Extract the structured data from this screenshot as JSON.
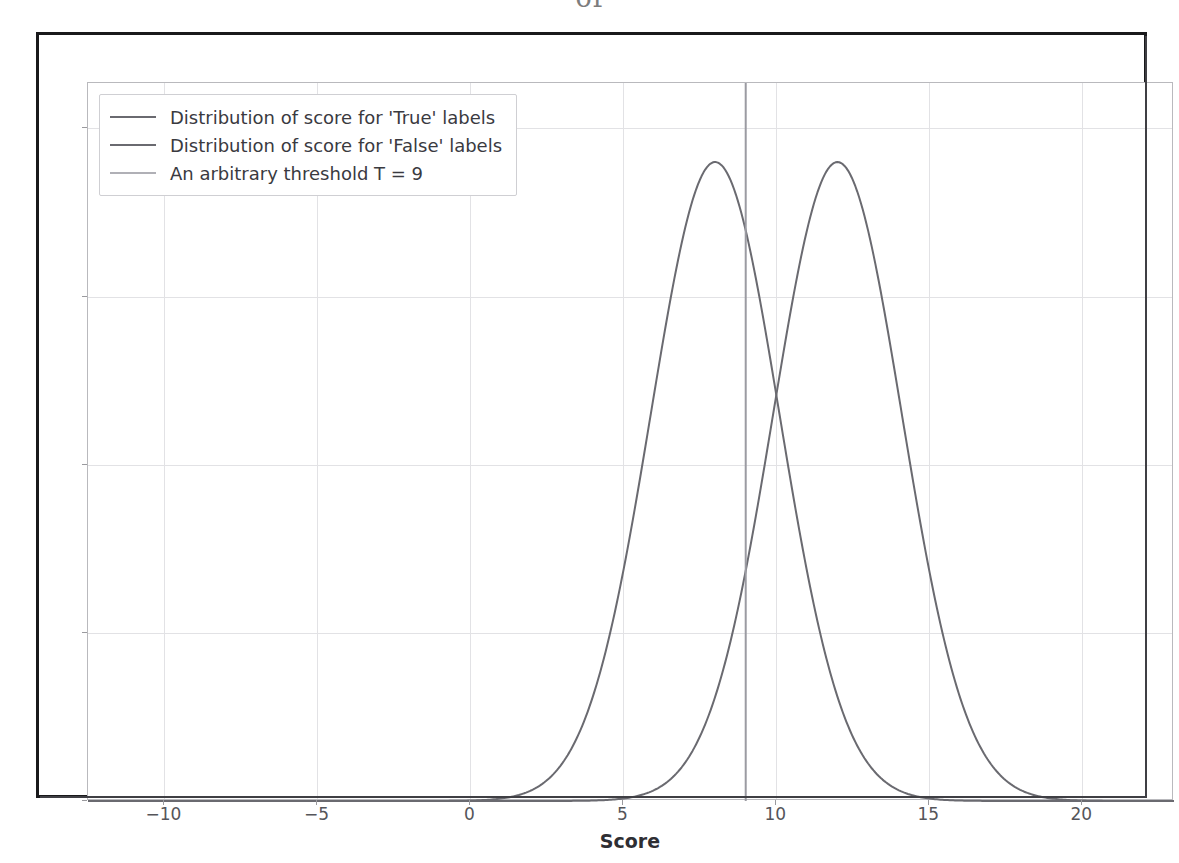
{
  "page_artifact": "of",
  "chart_data": {
    "type": "line",
    "title": "",
    "subtitle": "",
    "xlabel": "Score",
    "ylabel": "",
    "xlim": [
      -12.5,
      23.0
    ],
    "ylim": [
      0,
      0.2135
    ],
    "grid": true,
    "legend_position": "upper left",
    "x_ticks": [
      -10,
      -5,
      0,
      5,
      10,
      15,
      20
    ],
    "x_tick_labels": [
      "−10",
      "−5",
      "0",
      "5",
      "10",
      "15",
      "20"
    ],
    "y_ticks": [
      0.0,
      0.05,
      0.1,
      0.15,
      0.2
    ],
    "y_tick_labels": [
      "",
      "",
      "",
      "",
      ""
    ],
    "series": [
      {
        "name": "Distribution of score for 'True' labels",
        "kind": "gaussian-pdf",
        "mean": 8,
        "sigma": 2.1,
        "peak": 0.19,
        "color": "#6a6a70",
        "linewidth": 2
      },
      {
        "name": "Distribution of score for 'False' labels",
        "kind": "gaussian-pdf",
        "mean": 12,
        "sigma": 2.1,
        "peak": 0.19,
        "color": "#6a6a70",
        "linewidth": 2
      }
    ],
    "annotations": [
      {
        "name": "An arbitrary threshold T = 9",
        "kind": "vline",
        "x": 9,
        "color": "#9b9ba2",
        "linewidth": 2
      }
    ],
    "crossover_x": 10
  },
  "legend": {
    "entries": [
      {
        "label": "Distribution of score for 'True' labels",
        "color": "#6a6a70"
      },
      {
        "label": "Distribution of score for 'False' labels",
        "color": "#6a6a70"
      },
      {
        "label": "An arbitrary threshold T = 9",
        "color": "#b0b0b6"
      }
    ]
  }
}
